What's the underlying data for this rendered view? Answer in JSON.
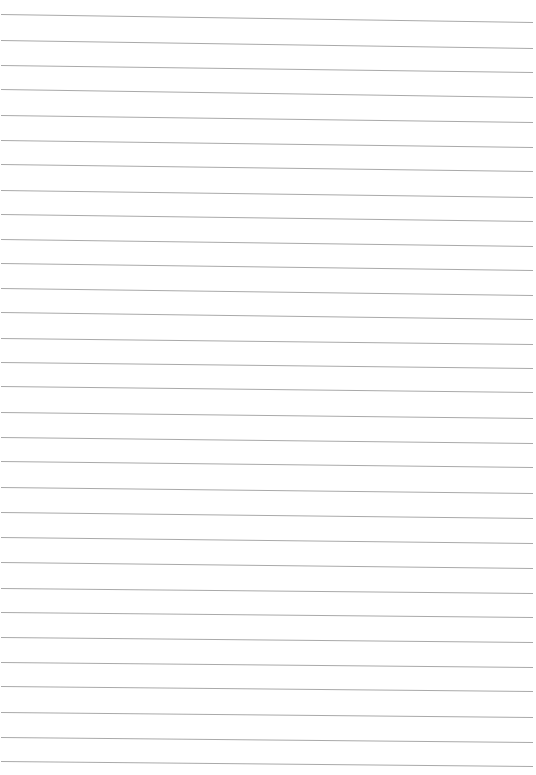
{
  "page": {
    "type": "lined-paper",
    "background_color": "#ffffff",
    "line_color": "#a9a9a9",
    "line_count": 31,
    "line_x_start": 1,
    "line_x_end": 533,
    "lines": [
      {
        "y_left": 14,
        "y_right": 22
      },
      {
        "y_left": 40,
        "y_right": 48
      },
      {
        "y_left": 65,
        "y_right": 72
      },
      {
        "y_left": 89,
        "y_right": 97
      },
      {
        "y_left": 115,
        "y_right": 122
      },
      {
        "y_left": 140,
        "y_right": 147
      },
      {
        "y_left": 164,
        "y_right": 171
      },
      {
        "y_left": 190,
        "y_right": 197
      },
      {
        "y_left": 214,
        "y_right": 221
      },
      {
        "y_left": 239,
        "y_right": 246
      },
      {
        "y_left": 263,
        "y_right": 270
      },
      {
        "y_left": 288,
        "y_right": 295
      },
      {
        "y_left": 312,
        "y_right": 319
      },
      {
        "y_left": 338,
        "y_right": 344
      },
      {
        "y_left": 362,
        "y_right": 368
      },
      {
        "y_left": 386,
        "y_right": 392
      },
      {
        "y_left": 412,
        "y_right": 418
      },
      {
        "y_left": 437,
        "y_right": 443
      },
      {
        "y_left": 461,
        "y_right": 467
      },
      {
        "y_left": 487,
        "y_right": 493
      },
      {
        "y_left": 512,
        "y_right": 518
      },
      {
        "y_left": 537,
        "y_right": 543
      },
      {
        "y_left": 562,
        "y_right": 568
      },
      {
        "y_left": 588,
        "y_right": 593
      },
      {
        "y_left": 612,
        "y_right": 617
      },
      {
        "y_left": 637,
        "y_right": 642
      },
      {
        "y_left": 662,
        "y_right": 667
      },
      {
        "y_left": 686,
        "y_right": 691
      },
      {
        "y_left": 712,
        "y_right": 717
      },
      {
        "y_left": 737,
        "y_right": 742
      },
      {
        "y_left": 761,
        "y_right": 766
      }
    ]
  }
}
